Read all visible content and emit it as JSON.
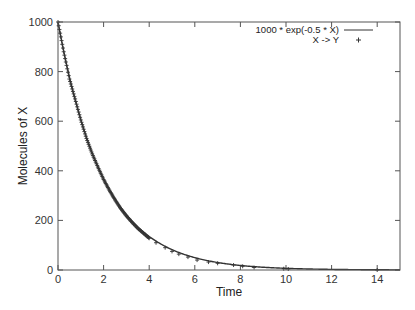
{
  "chart_data": {
    "type": "line",
    "title": "",
    "xlabel": "Time",
    "ylabel": "Molecules of X",
    "xlim": [
      0,
      15
    ],
    "ylim": [
      0,
      1000
    ],
    "xticks": [
      0,
      2,
      4,
      6,
      8,
      10,
      12,
      14
    ],
    "yticks": [
      0,
      200,
      400,
      600,
      800,
      1000
    ],
    "grid": false,
    "legend_position": "top-right (inside)",
    "series": [
      {
        "name": "1000 * exp(-0.5 * X)",
        "style": "line",
        "color": "#333333",
        "function": "1000*exp(-0.5*t)",
        "x": [
          0,
          0.5,
          1,
          1.5,
          2,
          2.5,
          3,
          3.5,
          4,
          5,
          6,
          7,
          8,
          9,
          10,
          11,
          12,
          13,
          14,
          15
        ],
        "values": [
          1000,
          779,
          607,
          472,
          368,
          287,
          223,
          174,
          135,
          82,
          50,
          30,
          18,
          11,
          7,
          4,
          2,
          2,
          1,
          1
        ]
      },
      {
        "name": "X -> Y",
        "style": "points",
        "marker": "+",
        "color": "#333333",
        "x": [
          0,
          0.25,
          0.5,
          0.75,
          1,
          1.25,
          1.5,
          1.75,
          2,
          2.25,
          2.5,
          2.75,
          3,
          3.25,
          3.5,
          3.75,
          4,
          4.3,
          4.7,
          5.0,
          5.3,
          5.7,
          6.1,
          6.6,
          7.0,
          7.7,
          8.1,
          8.6,
          9.9,
          10.1,
          14.0
        ],
        "values": [
          1000,
          880,
          770,
          690,
          605,
          530,
          468,
          415,
          365,
          322,
          283,
          248,
          218,
          192,
          168,
          148,
          128,
          110,
          90,
          75,
          64,
          52,
          40,
          32,
          27,
          20,
          15,
          10,
          5,
          4,
          0
        ]
      }
    ]
  },
  "legend": {
    "entries": [
      {
        "label": "1000 * exp(-0.5 * X)",
        "symbol": "line"
      },
      {
        "label": "X -> Y",
        "symbol": "+"
      }
    ]
  },
  "axes": {
    "xlabel": "Time",
    "ylabel": "Molecules of X",
    "xtick_labels": [
      "0",
      "2",
      "4",
      "6",
      "8",
      "10",
      "12",
      "14"
    ],
    "ytick_labels": [
      "0",
      "200",
      "400",
      "600",
      "800",
      "1000"
    ]
  }
}
